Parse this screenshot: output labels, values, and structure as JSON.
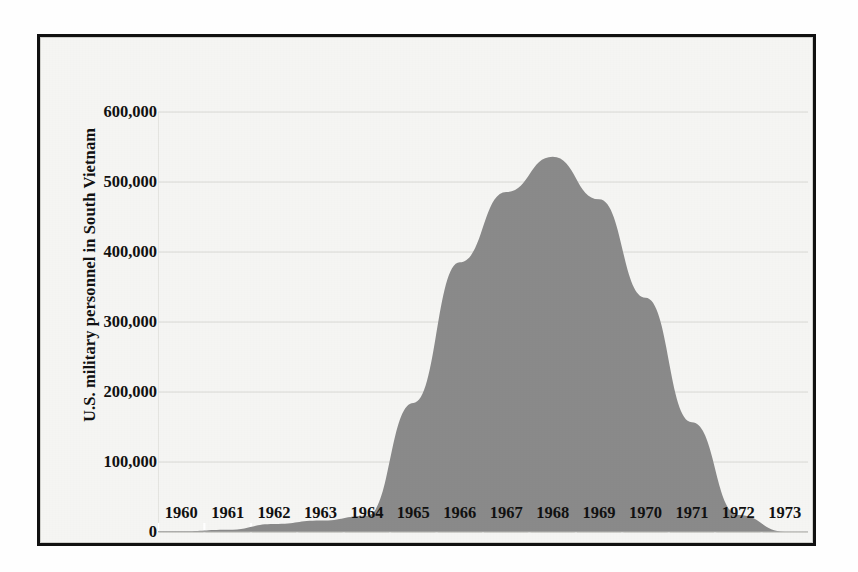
{
  "chart_data": {
    "type": "area",
    "title": "",
    "subtitle": "",
    "xlabel": "",
    "ylabel": "U.S. military personnel in South Vietnam",
    "x": [
      1960,
      1961,
      1962,
      1963,
      1964,
      1965,
      1966,
      1967,
      1968,
      1969,
      1970,
      1971,
      1972,
      1973
    ],
    "categories": [
      "1960",
      "1961",
      "1962",
      "1963",
      "1964",
      "1965",
      "1966",
      "1967",
      "1968",
      "1969",
      "1970",
      "1971",
      "1972",
      "1973"
    ],
    "values": [
      900,
      3200,
      11300,
      16300,
      23300,
      184300,
      385300,
      485600,
      536100,
      475200,
      334600,
      156800,
      24200,
      500
    ],
    "series": [
      {
        "name": "U.S. military personnel in South Vietnam",
        "values": [
          900,
          3200,
          11300,
          16300,
          23300,
          184300,
          385300,
          485600,
          536100,
          475200,
          334600,
          156800,
          24200,
          500
        ]
      }
    ],
    "ylim": [
      0,
      600000
    ],
    "xlim": [
      1960,
      1973
    ],
    "yticks": [
      0,
      100000,
      200000,
      300000,
      400000,
      500000,
      600000
    ],
    "ytick_labels": [
      "0",
      "100,000",
      "200,000",
      "300,000",
      "400,000",
      "500,000",
      "600,000"
    ],
    "xtick_labels": [
      "1960",
      "1961",
      "1962",
      "1963",
      "1964",
      "1965",
      "1966",
      "1967",
      "1968",
      "1969",
      "1970",
      "1971",
      "1972",
      "1973"
    ],
    "grid": true,
    "grid_axis": "y",
    "legend": false,
    "legend_position": "none",
    "peak_year": "1968",
    "peak_value": 536100,
    "colors": {
      "area_fill": "#8a8a8a",
      "grid_line": "#d8d8d4",
      "axis_text": "#111111",
      "plot_background": "#f5f5f3",
      "frame_border": "#111111",
      "page_background": "#fefefe"
    }
  }
}
